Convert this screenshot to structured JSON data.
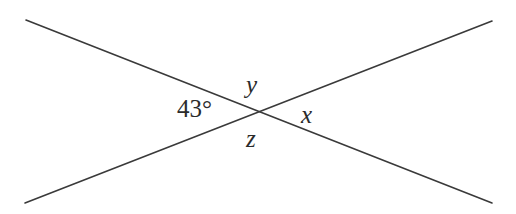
{
  "figure": {
    "kind": "geometry-diagram",
    "background_color": "#ffffff",
    "stroke_color": "#3a3a3a",
    "text_color": "#2b2b2b",
    "stroke_width": 1.6,
    "width": 516,
    "height": 214
  },
  "intersection": {
    "label": "intersection-point",
    "x": 255,
    "y": 112
  },
  "lines": [
    {
      "name": "line-descending",
      "from_x": 26,
      "from_y": 20,
      "to_x": 492,
      "to_y": 203
    },
    {
      "name": "line-ascending",
      "from_x": 25,
      "from_y": 203,
      "to_x": 492,
      "to_y": 21
    }
  ],
  "labels": {
    "angle_left": "43°",
    "angle_top": "y",
    "angle_right": "x",
    "angle_bottom": "z"
  },
  "chart_data": {
    "type": "diagram",
    "title": "",
    "angles": [
      {
        "name": "left",
        "label": "43°",
        "value": 43,
        "unit": "degrees",
        "position": {
          "x": 199,
          "y": 108
        }
      },
      {
        "name": "top",
        "label": "y",
        "value": null,
        "unit": "degrees",
        "position": {
          "x": 255,
          "y": 85
        }
      },
      {
        "name": "right",
        "label": "x",
        "value": null,
        "unit": "degrees",
        "position": {
          "x": 310,
          "y": 115
        }
      },
      {
        "name": "bottom",
        "label": "z",
        "value": null,
        "unit": "degrees",
        "position": {
          "x": 253,
          "y": 139
        }
      }
    ]
  }
}
